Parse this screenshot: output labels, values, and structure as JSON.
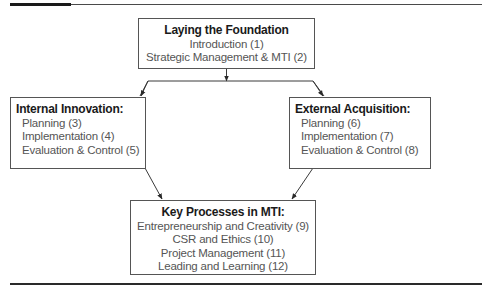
{
  "diagram": {
    "top_box": {
      "title": "Laying the Foundation",
      "items": [
        "Introduction (1)",
        "Strategic Management & MTI (2)"
      ]
    },
    "left_box": {
      "title": "Internal Innovation:",
      "items": [
        "Planning (3)",
        "Implementation (4)",
        "Evaluation & Control (5)"
      ]
    },
    "right_box": {
      "title": "External Acquisition:",
      "items": [
        "Planning (6)",
        "Implementation (7)",
        "Evaluation & Control (8)"
      ]
    },
    "bottom_box": {
      "title": "Key Processes in MTI:",
      "items": [
        "Entrepreneurship and Creativity (9)",
        "CSR and Ethics (10)",
        "Project Management (11)",
        "Leading and Learning (12)"
      ]
    },
    "connectors": [
      {
        "from": "top_box",
        "to": "split"
      },
      {
        "from": "split",
        "to": "left_box"
      },
      {
        "from": "split",
        "to": "right_box"
      },
      {
        "from": "left_box",
        "to": "bottom_box"
      },
      {
        "from": "right_box",
        "to": "bottom_box"
      }
    ],
    "colors": {
      "line": "#3a3a3a",
      "box_border": "#555555",
      "title_text": "#1a1a1a",
      "item_text": "#555555"
    }
  }
}
